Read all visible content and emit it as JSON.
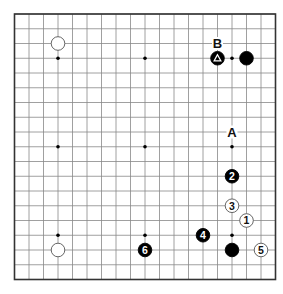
{
  "board": {
    "size": 19,
    "left": 14.5,
    "top": 14,
    "dx": 14.5,
    "dy": 14.75,
    "line_color": "#888888",
    "border_color": "#333333",
    "hoshi": [
      [
        3,
        3
      ],
      [
        9,
        3
      ],
      [
        15,
        3
      ],
      [
        3,
        9
      ],
      [
        9,
        9
      ],
      [
        15,
        9
      ],
      [
        3,
        15
      ],
      [
        9,
        15
      ],
      [
        15,
        15
      ]
    ]
  },
  "stones": [
    {
      "color": "white",
      "col": 3,
      "row": 2,
      "label": ""
    },
    {
      "color": "black",
      "col": 14,
      "row": 3,
      "label": "",
      "marker": "triangle"
    },
    {
      "color": "black",
      "col": 16,
      "row": 3,
      "label": ""
    },
    {
      "color": "white",
      "col": 16,
      "row": 14,
      "label": "1"
    },
    {
      "color": "black",
      "col": 15,
      "row": 11,
      "label": "2"
    },
    {
      "color": "white",
      "col": 15,
      "row": 13,
      "label": "3"
    },
    {
      "color": "black",
      "col": 13,
      "row": 15,
      "label": "4"
    },
    {
      "color": "white",
      "col": 17,
      "row": 16,
      "label": "5"
    },
    {
      "color": "black",
      "col": 9,
      "row": 16,
      "label": "6"
    },
    {
      "color": "black",
      "col": 15,
      "row": 16,
      "label": ""
    },
    {
      "color": "white",
      "col": 3,
      "row": 16,
      "label": ""
    }
  ],
  "letters": [
    {
      "text": "B",
      "col": 14,
      "row": 2
    },
    {
      "text": "A",
      "col": 15,
      "row": 8
    }
  ]
}
